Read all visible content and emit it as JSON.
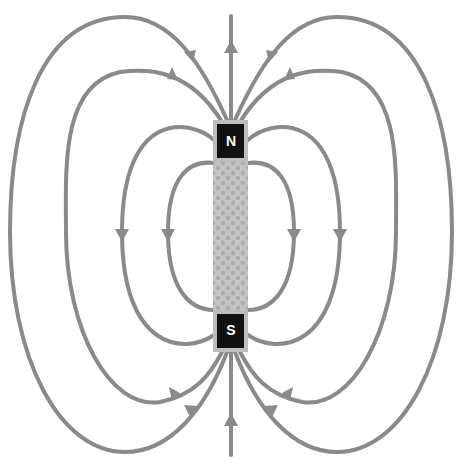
{
  "diagram": {
    "magnet": {
      "north_label": "N",
      "south_label": "S",
      "body_color": "#bdbdbd",
      "pole_color": "#111111",
      "pole_text_color": "#ffffff"
    },
    "field_lines": {
      "color": "#8a8a8a",
      "count_per_side": 4,
      "direction": "out of N, into S",
      "axial_line": "vertical line through both poles, arrows pointing up"
    }
  }
}
